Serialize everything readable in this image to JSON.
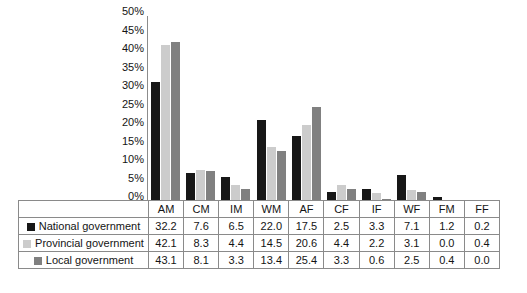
{
  "chart_data": {
    "type": "bar",
    "title": "",
    "xlabel": "",
    "ylabel": "",
    "ylim": [
      0,
      50
    ],
    "ytick_labels": [
      "50%",
      "45%",
      "40%",
      "35%",
      "30%",
      "25%",
      "20%",
      "15%",
      "10%",
      "5%",
      "0%"
    ],
    "ytick_values": [
      50,
      45,
      40,
      35,
      30,
      25,
      20,
      15,
      10,
      5,
      0
    ],
    "grid": false,
    "legend_position": "table-left-column",
    "categories": [
      "AM",
      "CM",
      "IM",
      "WM",
      "AF",
      "CF",
      "IF",
      "WF",
      "FM",
      "FF"
    ],
    "series": [
      {
        "name": "National government",
        "color": "#171717",
        "values": [
          32.2,
          7.6,
          6.5,
          22.0,
          17.5,
          2.5,
          3.3,
          7.1,
          1.2,
          0.2
        ]
      },
      {
        "name": "Provincial government",
        "color": "#cccccc",
        "values": [
          42.1,
          8.3,
          4.4,
          14.5,
          20.6,
          4.4,
          2.2,
          3.1,
          0.0,
          0.4
        ]
      },
      {
        "name": "Local government",
        "color": "#808080",
        "values": [
          43.1,
          8.1,
          3.3,
          13.4,
          25.4,
          3.3,
          0.6,
          2.5,
          0.4,
          0.0
        ]
      }
    ]
  },
  "table": {
    "legend_corner": "",
    "row_labels": [
      "National government",
      "Provincial government",
      "Local government"
    ]
  }
}
